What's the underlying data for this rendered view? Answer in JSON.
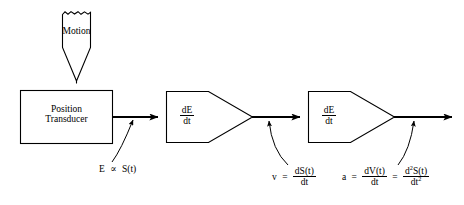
{
  "diagram": {
    "stroke_color": "#000000",
    "background_color": "#ffffff",
    "nodes": {
      "motion_source": {
        "label": "Motion",
        "shape": "torn-top-pointer"
      },
      "transducer": {
        "line1": "Position",
        "line2": "Transducer",
        "shape": "rectangle"
      },
      "differentiator_1": {
        "numerator": "dE",
        "denominator": "dt",
        "shape": "pentagon-arrow"
      },
      "differentiator_2": {
        "numerator": "dE",
        "denominator": "dt",
        "shape": "pentagon-arrow"
      }
    },
    "annotations": {
      "signal_e": {
        "lhs": "E",
        "operator": "∝",
        "rhs": "S(t)"
      },
      "velocity": {
        "lhs": "v",
        "operator": "=",
        "numerator": "dS(t)",
        "denominator": "dt"
      },
      "acceleration": {
        "lhs": "a",
        "operator1": "=",
        "numerator1": "dV(t)",
        "denominator1": "dt",
        "operator2": "=",
        "numerator2_pre": "d",
        "numerator2_sup": "2",
        "numerator2_post": "S(t)",
        "denominator2_pre": "dt",
        "denominator2_sup": "2"
      }
    }
  }
}
